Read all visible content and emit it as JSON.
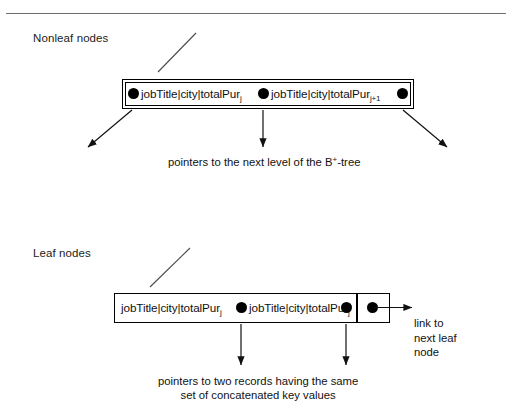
{
  "figure": {
    "labels": {
      "nonleaf": "Nonleaf nodes",
      "leaf": "Leaf nodes"
    },
    "nonleaf_node": {
      "entries": [
        {
          "key": "jobTitle|city|totalPur",
          "subscript": "j"
        },
        {
          "key": "jobTitle|city|totalPur",
          "subscript": "j+1"
        }
      ],
      "pointer_count": 3
    },
    "leaf_node": {
      "entries": [
        {
          "key": "jobTitle|city|totalPur",
          "subscript": "j"
        },
        {
          "key": "jobTitle|city|totalPur",
          "subscript": "j"
        }
      ],
      "pointer_count": 3
    },
    "captions": {
      "nonleaf_pointers_pre": "pointers to the next level of the B",
      "nonleaf_pointers_sup": "+",
      "nonleaf_pointers_post": "-tree",
      "leaf_pointers_line1": "pointers to two records having the same",
      "leaf_pointers_line2": "set of concatenated key values",
      "link_line1": "link to",
      "link_line2": "next leaf",
      "link_line3": "node"
    },
    "colors": {
      "stroke": "#000000",
      "rule": "#6e6e6e",
      "text": "#111111",
      "background": "#ffffff"
    }
  }
}
